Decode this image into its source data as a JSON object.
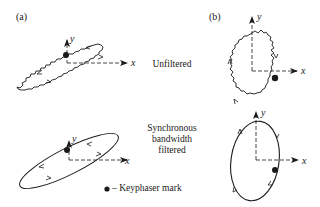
{
  "panels": {
    "a": {
      "label": "(a)"
    },
    "b": {
      "label": "(b)"
    }
  },
  "rows": {
    "unfiltered": {
      "label": "Unfiltered"
    },
    "filtered": {
      "line1": "Synchronous",
      "line2": "bandwidth",
      "line3": "filtered"
    }
  },
  "axes": {
    "x": "x",
    "y": "y"
  },
  "legend": {
    "marker": "keyphasor-dot",
    "text": "– Keyphaser mark"
  },
  "colors": {
    "ink": "#1a1a1a",
    "background": "#ffffff"
  }
}
